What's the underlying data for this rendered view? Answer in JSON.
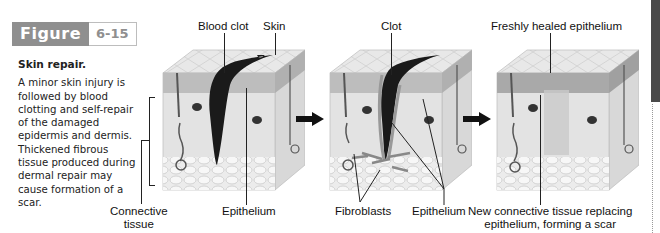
{
  "figure": {
    "label": "Figure",
    "number": "6-15",
    "title": "Skin repair.",
    "caption": "A minor skin injury is followed by blood clotting and self-repair of the damaged epidermis and dermis. Thickened fibrous tissue produced during dermal repair may cause formation of a scar.",
    "header_colors": {
      "label_bg": "#8f8f8f",
      "number_text": "#8f8f8f"
    }
  },
  "panels": [
    {
      "stage": "injury with blood clot",
      "labels": {
        "blood_clot": "Blood clot",
        "skin": "Skin",
        "connective_tissue_line1": "Connective",
        "connective_tissue_line2": "tissue",
        "epithelium": "Epithelium"
      }
    },
    {
      "stage": "repair in progress",
      "labels": {
        "clot": "Clot",
        "fibroblasts": "Fibroblasts",
        "epithelium": "Epithelium"
      }
    },
    {
      "stage": "healed with scar",
      "labels": {
        "freshly_healed_epithelium": "Freshly healed epithelium",
        "scar_line1": "New connective tissue replacing",
        "scar_line2": "epithelium, forming a scar"
      }
    }
  ],
  "arrows": [
    "arrow-right",
    "arrow-right"
  ]
}
